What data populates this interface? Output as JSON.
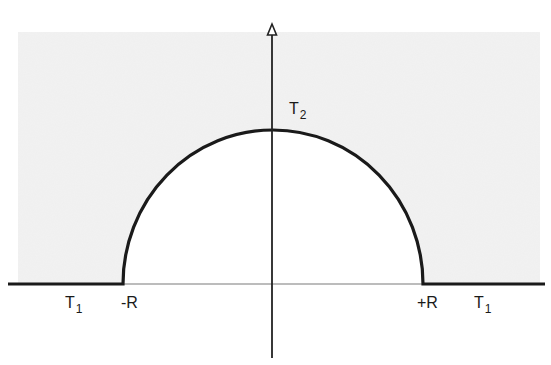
{
  "diagram": {
    "title": "",
    "colors": {
      "background": "#ffffff",
      "region_outside": "#f2f2f2",
      "region_inside": "#ffffff",
      "boundary_stroke": "#1a1a1a",
      "axis_stroke": "#222222",
      "thin_axis_stroke": "#7a7a7a"
    },
    "geometry": {
      "origin_x": 273,
      "axis_y": 284,
      "radius_x": 150,
      "radius_y": 154,
      "vertical_axis_top": 24,
      "vertical_axis_bottom": 358,
      "boundary_left_x": 8,
      "boundary_right_x": 545,
      "shaded_left_x": 18,
      "shaded_right_x": 540,
      "shaded_top_y": 32
    },
    "labels": {
      "t2": {
        "base": "T",
        "sub": "2"
      },
      "t1_left": {
        "base": "T",
        "sub": "1"
      },
      "t1_right": {
        "base": "T",
        "sub": "1"
      },
      "minus_r": "-R",
      "plus_r": "+R"
    }
  }
}
